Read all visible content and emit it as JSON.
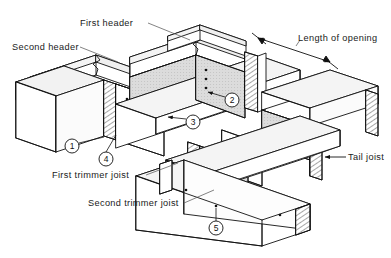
{
  "diagram": {
    "type": "isometric-line-drawing",
    "background_color": "#ffffff",
    "line_color": "#111111",
    "hatch_color": "#333333",
    "shade_fill": "#d9d9d9",
    "labels": [
      {
        "id": "first-header",
        "text": "First header",
        "x": 80,
        "y": 18
      },
      {
        "id": "second-header",
        "text": "Second header",
        "x": 12,
        "y": 42
      },
      {
        "id": "length-of-opening",
        "text": "Length of opening",
        "x": 298,
        "y": 33
      },
      {
        "id": "tail-joist",
        "text": "Tail joist",
        "x": 348,
        "y": 152
      },
      {
        "id": "first-trimmer-joist",
        "text": "First trimmer joist",
        "x": 52,
        "y": 170
      },
      {
        "id": "second-trimmer-joist",
        "text": "Second trimmer joist",
        "x": 88,
        "y": 198
      }
    ],
    "callouts": [
      {
        "id": "callout-1",
        "number": "1",
        "cx": 72,
        "cy": 146
      },
      {
        "id": "callout-2",
        "number": "2",
        "cx": 232,
        "cy": 100
      },
      {
        "id": "callout-3",
        "number": "3",
        "cx": 193,
        "cy": 122
      },
      {
        "id": "callout-4",
        "number": "4",
        "cx": 106,
        "cy": 159
      },
      {
        "id": "callout-5",
        "number": "5",
        "cx": 216,
        "cy": 228
      }
    ],
    "parts": [
      {
        "id": "first-header",
        "name": "First header"
      },
      {
        "id": "second-header",
        "name": "Second header"
      },
      {
        "id": "first-trimmer-joist",
        "name": "First trimmer joist"
      },
      {
        "id": "second-trimmer-joist",
        "name": "Second trimmer joist"
      },
      {
        "id": "tail-joist",
        "name": "Tail joist"
      }
    ],
    "dimension": {
      "id": "length-of-opening",
      "name": "Length of opening",
      "arrow_style": "double-headed"
    }
  }
}
